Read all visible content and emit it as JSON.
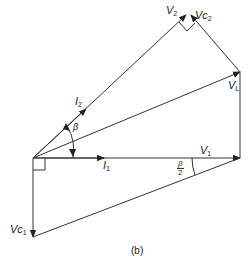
{
  "figure": {
    "caption": "(b)",
    "labels": {
      "V2": {
        "main": "V",
        "sub": "2"
      },
      "Vc2": {
        "main": "Vc",
        "sub": "2"
      },
      "VL": {
        "main": "V",
        "sub": "L"
      },
      "I2": {
        "main": "I",
        "sub": "2"
      },
      "beta": "β",
      "I1": {
        "main": "I",
        "sub": "1"
      },
      "V1": {
        "main": "V",
        "sub": "1"
      },
      "beta_half_num": "β",
      "beta_half_den": "2",
      "Vc1": {
        "main": "Vc",
        "sub": "1"
      }
    },
    "colors": {
      "line": "#333333",
      "text": "#222222"
    }
  }
}
